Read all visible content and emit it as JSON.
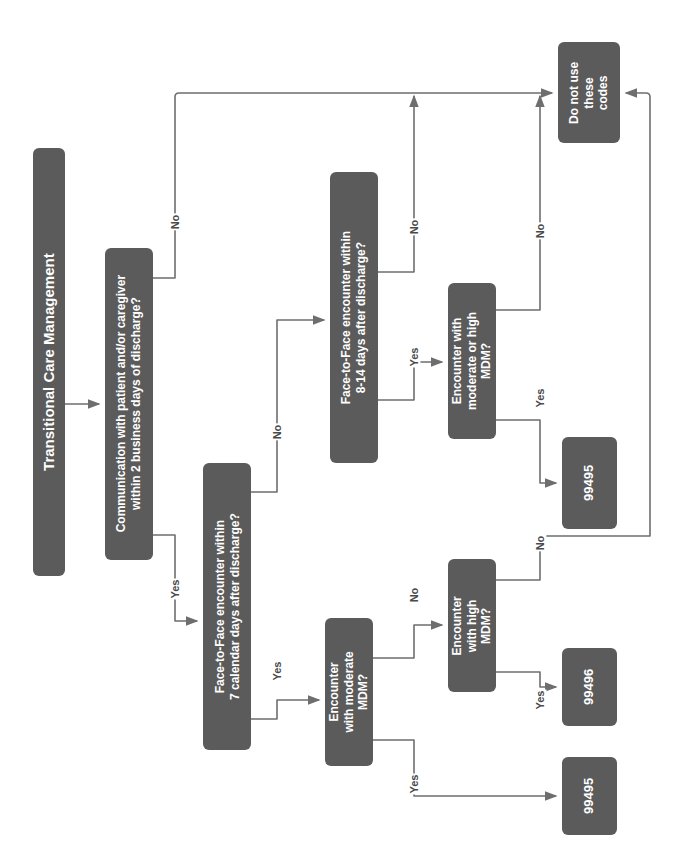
{
  "diagram": {
    "title": "Transitional Care Management",
    "orientation": "rotated-90-ccw",
    "colors": {
      "node_fill": "#5b5b5b",
      "node_text": "#ffffff",
      "connector": "#6e6e6e",
      "background": "#ffffff",
      "edge_label": "#4a4a4a"
    },
    "nodes": [
      {
        "id": "title",
        "name": "title-node",
        "text": "Transitional Care Management",
        "x": 33,
        "y": 148,
        "w": 32,
        "h": 428,
        "font_size": 15
      },
      {
        "id": "communication",
        "name": "communication-decision",
        "text": "Communication with patient and/or caregiver\nwithin 2 business days of discharge?",
        "x": 105,
        "y": 248,
        "w": 48,
        "h": 312,
        "font_size": 12
      },
      {
        "id": "f2f7",
        "name": "face-to-face-7-days-decision",
        "text": "Face-to-Face encounter within\n7 calendar days after discharge?",
        "x": 203,
        "y": 463,
        "w": 48,
        "h": 287,
        "font_size": 12
      },
      {
        "id": "f2f814",
        "name": "face-to-face-8-14-days-decision",
        "text": "Face-to-Face encounter within\n8-14 days after discharge?",
        "x": 330,
        "y": 172,
        "w": 48,
        "h": 291,
        "font_size": 12
      },
      {
        "id": "mdm_mod_high",
        "name": "moderate-or-high-mdm-decision",
        "text": "Encounter with\nmoderate or high\nMDM?",
        "x": 448,
        "y": 283,
        "w": 48,
        "h": 156,
        "font_size": 12
      },
      {
        "id": "mdm_mod",
        "name": "moderate-mdm-decision",
        "text": "Encounter\nwith moderate\nMDM?",
        "x": 325,
        "y": 618,
        "w": 48,
        "h": 148,
        "font_size": 12
      },
      {
        "id": "mdm_high",
        "name": "high-mdm-decision",
        "text": "Encounter\nwith high\nMDM?",
        "x": 448,
        "y": 559,
        "w": 48,
        "h": 133,
        "font_size": 12
      },
      {
        "id": "donotuse",
        "name": "do-not-use-codes-terminal",
        "text": "Do not use\nthese\ncodes",
        "x": 558,
        "y": 42,
        "w": 62,
        "h": 101,
        "font_size": 12
      },
      {
        "id": "code_99495_top",
        "name": "code-99495-top-terminal",
        "text": "99495",
        "x": 562,
        "y": 437,
        "w": 55,
        "h": 92,
        "font_size": 13
      },
      {
        "id": "code_99496",
        "name": "code-99496-terminal",
        "text": "99496",
        "x": 562,
        "y": 648,
        "w": 55,
        "h": 78,
        "font_size": 13
      },
      {
        "id": "code_99495_bottom",
        "name": "code-99495-bottom-terminal",
        "text": "99495",
        "x": 562,
        "y": 757,
        "w": 55,
        "h": 78,
        "font_size": 13
      }
    ],
    "edge_labels": [
      {
        "id": "comm-no",
        "name": "edge-label-communication-no",
        "text": "No",
        "x": 175,
        "y": 222
      },
      {
        "id": "comm-yes",
        "name": "edge-label-communication-yes",
        "text": "Yes",
        "x": 175,
        "y": 589
      },
      {
        "id": "f2f7-no",
        "name": "edge-label-f2f7-no",
        "text": "No",
        "x": 277,
        "y": 432
      },
      {
        "id": "f2f7-yes",
        "name": "edge-label-f2f7-yes",
        "text": "Yes",
        "x": 277,
        "y": 671
      },
      {
        "id": "f2f814-no",
        "name": "edge-label-f2f814-no",
        "text": "No",
        "x": 414,
        "y": 227
      },
      {
        "id": "f2f814-yes",
        "name": "edge-label-f2f814-yes",
        "text": "Yes",
        "x": 414,
        "y": 357
      },
      {
        "id": "modhigh-no",
        "name": "edge-label-moderate-high-no",
        "text": "No",
        "x": 540,
        "y": 231
      },
      {
        "id": "modhigh-yes",
        "name": "edge-label-moderate-high-yes",
        "text": "Yes",
        "x": 540,
        "y": 398
      },
      {
        "id": "mdmmod-no",
        "name": "edge-label-moderate-no",
        "text": "No",
        "x": 414,
        "y": 595
      },
      {
        "id": "mdmmod-yes",
        "name": "edge-label-moderate-yes",
        "text": "Yes",
        "x": 414,
        "y": 784
      },
      {
        "id": "mdmhigh-no",
        "name": "edge-label-high-no",
        "text": "No",
        "x": 540,
        "y": 543
      },
      {
        "id": "mdmhigh-yes",
        "name": "edge-label-high-yes",
        "text": "Yes",
        "x": 540,
        "y": 700
      }
    ]
  }
}
